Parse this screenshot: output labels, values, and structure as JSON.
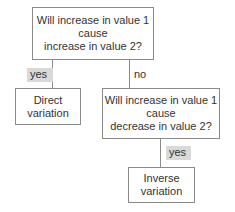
{
  "nodes": {
    "q1": {
      "lines": [
        "Will increase in value 1",
        "cause",
        "increase in value 2?"
      ]
    },
    "direct": {
      "lines": [
        "Direct",
        "variation"
      ]
    },
    "q2": {
      "lines": [
        "Will increase in value 1",
        "cause",
        "decrease in value 2?"
      ]
    },
    "inverse": {
      "lines": [
        "Inverse",
        "variation"
      ]
    }
  },
  "edges": {
    "q1_to_direct": {
      "label": "yes"
    },
    "q1_to_q2": {
      "label": "no"
    },
    "q2_to_inverse": {
      "label": "yes"
    }
  },
  "colors": {
    "border": "#8a8a8a",
    "label_shade": "#d9d9d9",
    "text": "#333333"
  }
}
